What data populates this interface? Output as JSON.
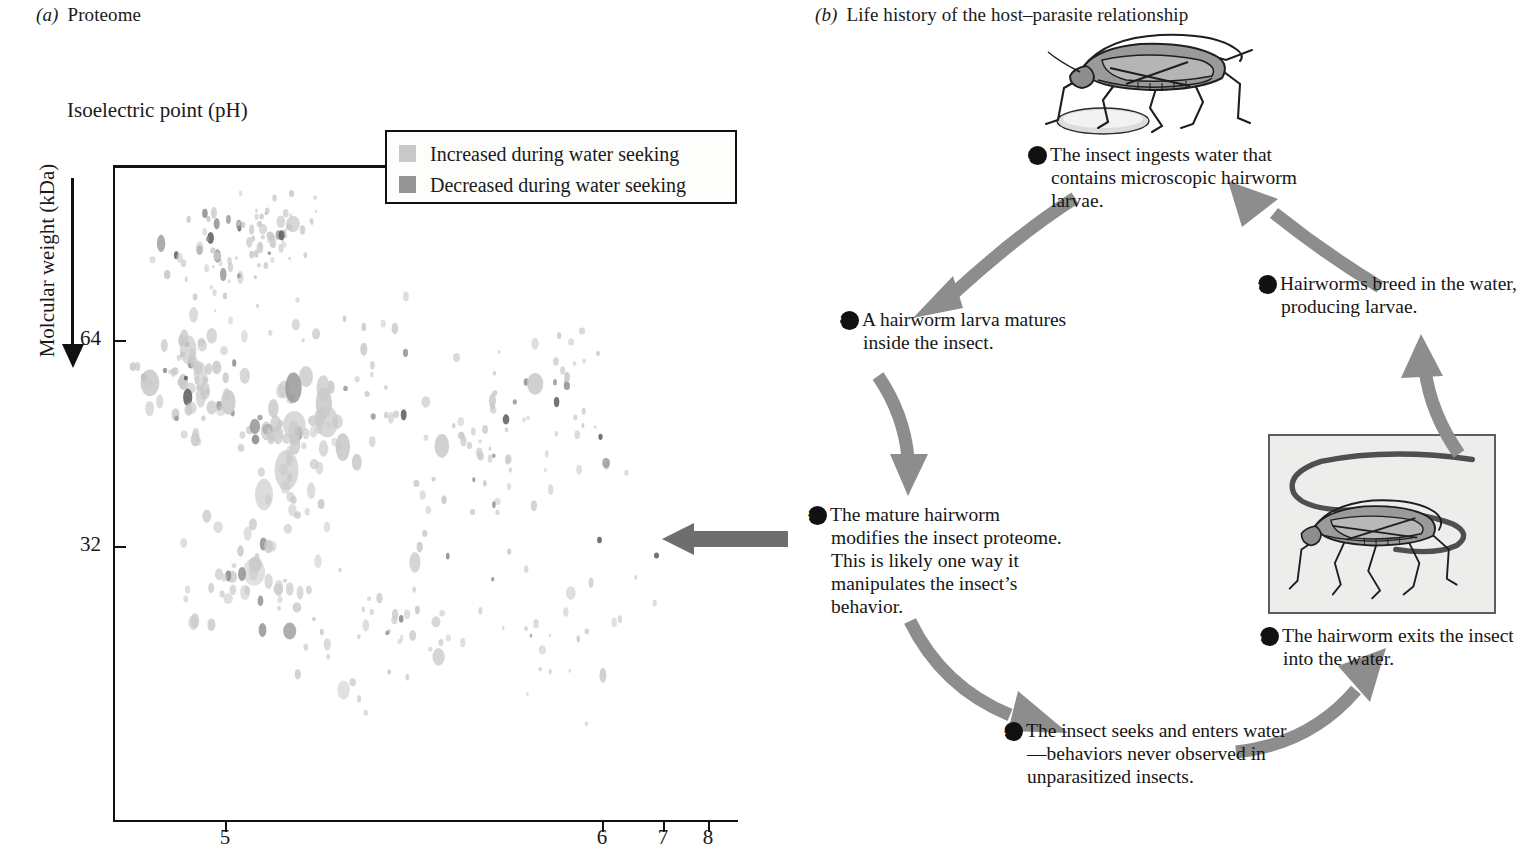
{
  "panel_a": {
    "letter": "(a)",
    "title": "Proteome",
    "x_axis_title": "Isoelectric point (pH)",
    "y_axis_title": "Molcular weight (kDa)",
    "x_ticks": [
      {
        "label": "5",
        "x": 225
      },
      {
        "label": "6",
        "x": 602
      },
      {
        "label": "7",
        "x": 663
      },
      {
        "label": "8",
        "x": 708
      }
    ],
    "y_ticks": [
      {
        "label": "64",
        "y": 340
      },
      {
        "label": "32",
        "y": 546
      }
    ],
    "legend": [
      {
        "label": "Increased during water seeking",
        "color": "#c9c9c9"
      },
      {
        "label": "Decreased during water seeking",
        "color": "#949494"
      }
    ]
  },
  "panel_b": {
    "letter": "(b)",
    "title": "Life history of the host–parasite relationship",
    "steps": [
      {
        "num": "1",
        "text": "The insect ingests water that contains microscopic hairworm larvae."
      },
      {
        "num": "2",
        "text": "A hairworm larva matures inside the insect."
      },
      {
        "num": "3",
        "text": "The mature hairworm modifies the insect proteome. This is likely one way it manipulates the insect’s behavior."
      },
      {
        "num": "4",
        "text": "The insect seeks and enters water—behaviors never observed in unparasitized insects."
      },
      {
        "num": "5",
        "text": "The hairworm exits the insect into the water."
      },
      {
        "num": "6",
        "text": "Hairworms breed in the water, producing larvae."
      }
    ]
  },
  "chart_data": {
    "type": "scatter",
    "title": "Proteome",
    "xlabel": "Isoelectric point (pH)",
    "ylabel": "Molcular weight (kDa)",
    "xlim": [
      4.2,
      8.3
    ],
    "ylim": [
      120,
      10
    ],
    "grid": false,
    "legend_position": "top-right",
    "series": [
      {
        "name": "Increased during water seeking",
        "color": "#c9c9c9"
      },
      {
        "name": "Decreased during water seeking",
        "color": "#949494"
      }
    ],
    "spot_count_approx": 430
  },
  "colors": {
    "ink": "#1a1a1a",
    "spot_light": "#c9c9c9",
    "spot_dark": "#949494",
    "spot_darkest": "#5a5a5a",
    "cycle_arrow": "#8d8d8d",
    "proteome_arrow": "#6e6e6e",
    "insect_body": "#9a9a9a",
    "photo_bg": "#eeeeec"
  }
}
